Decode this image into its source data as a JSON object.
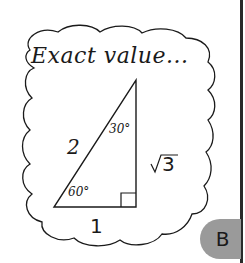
{
  "bubble": {
    "title": "Exact value..."
  },
  "triangle": {
    "hypotenuse_label": "2",
    "top_angle_label": "30°",
    "bottom_angle_label": "60°",
    "vertical_side_label": "√3",
    "base_label": "1"
  },
  "tab": {
    "label": "B",
    "color": "#9a9a9a"
  },
  "colors": {
    "ink": "#1a1a1a",
    "background": "#ffffff"
  }
}
